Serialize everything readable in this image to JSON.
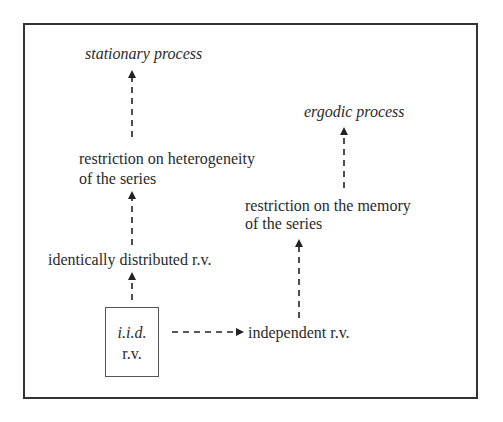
{
  "diagram": {
    "nodes": {
      "stationary": {
        "label": "stationary process",
        "italic": true
      },
      "heterogeneity": {
        "line1": "restriction on heterogeneity",
        "line2": "of the series"
      },
      "identically": {
        "label": "identically distributed r.v."
      },
      "iid": {
        "line1": "i.i.d.",
        "line2": "r.v."
      },
      "independent": {
        "label": "independent r.v."
      },
      "memory": {
        "line1": "restriction on the memory",
        "line2": "of the series"
      },
      "ergodic": {
        "label": "ergodic process",
        "italic": true
      }
    },
    "edges": [
      {
        "from": "iid",
        "to": "identically",
        "style": "dashed"
      },
      {
        "from": "identically",
        "to": "heterogeneity",
        "style": "dashed"
      },
      {
        "from": "heterogeneity",
        "to": "stationary",
        "style": "dashed"
      },
      {
        "from": "iid",
        "to": "independent",
        "style": "dashed"
      },
      {
        "from": "independent",
        "to": "memory",
        "style": "dashed"
      },
      {
        "from": "memory",
        "to": "ergodic",
        "style": "dashed"
      }
    ],
    "colors": {
      "frame": "#333333",
      "text": "#2a2a2a",
      "arrow": "#222222"
    }
  }
}
